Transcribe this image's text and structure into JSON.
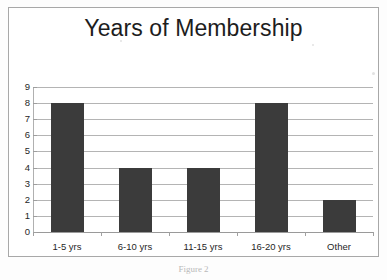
{
  "chart_data": {
    "type": "bar",
    "title": "Years of Membership",
    "xlabel": "",
    "ylabel": "",
    "categories": [
      "1-5 yrs",
      "6-10 yrs",
      "11-15 yrs",
      "16-20 yrs",
      "Other"
    ],
    "values": [
      8,
      4,
      4,
      8,
      2
    ],
    "ylim": [
      0,
      9
    ],
    "ytick_labels": [
      "0",
      "1",
      "2",
      "3",
      "4",
      "5",
      "6",
      "7",
      "8",
      "9"
    ],
    "ytick_values": [
      0,
      1,
      2,
      3,
      4,
      5,
      6,
      7,
      8,
      9
    ],
    "grid": true,
    "grid_axis": "y",
    "legend": false,
    "legend_position": "none",
    "bar_color": "#3b3b3b",
    "gridline_color": "#b4b4b4",
    "frame_color": "#a8a8a8",
    "background_color": "#ffffff"
  },
  "caption": {
    "text": "Figure 2"
  }
}
